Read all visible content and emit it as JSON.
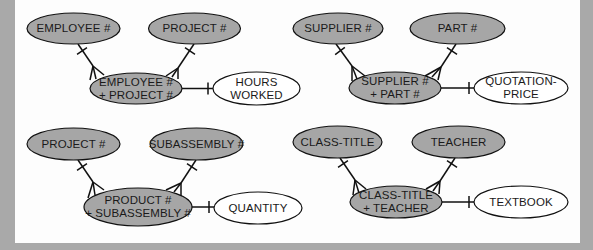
{
  "colors": {
    "key_fill": "#a6a6a6",
    "attribute_fill": "#ffffff",
    "line": "#111111",
    "background": "#fdfdfd",
    "frame": "#a9a9a9"
  },
  "diagrams": [
    {
      "id": "employee-project",
      "left_entity": {
        "label": "EMPLOYEE #"
      },
      "right_entity": {
        "label": "PROJECT #"
      },
      "concatenated_key": {
        "lines": [
          "EMPLOYEE #",
          "+ PROJECT #"
        ]
      },
      "attribute": {
        "lines": [
          "HOURS",
          "WORKED"
        ]
      }
    },
    {
      "id": "supplier-part",
      "left_entity": {
        "label": "SUPPLIER #"
      },
      "right_entity": {
        "label": "PART #"
      },
      "concatenated_key": {
        "lines": [
          "SUPPLIER #",
          "+ PART #"
        ]
      },
      "attribute": {
        "lines": [
          "QUOTATION-",
          "PRICE"
        ]
      }
    },
    {
      "id": "project-subassembly",
      "left_entity": {
        "label": "PROJECT #"
      },
      "right_entity": {
        "label": "SUBASSEMBLY #"
      },
      "concatenated_key": {
        "lines": [
          "PRODUCT #",
          "+ SUBASSEMBLY #"
        ]
      },
      "attribute": {
        "lines": [
          "QUANTITY"
        ]
      }
    },
    {
      "id": "class-teacher",
      "left_entity": {
        "label": "CLASS-TITLE"
      },
      "right_entity": {
        "label": "TEACHER"
      },
      "concatenated_key": {
        "lines": [
          "CLASS-TITLE",
          "+ TEACHER"
        ]
      },
      "attribute": {
        "lines": [
          "TEXTBOOK"
        ]
      }
    }
  ]
}
